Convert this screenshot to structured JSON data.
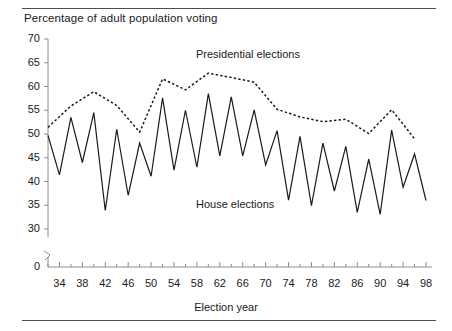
{
  "chart_data": {
    "type": "line",
    "title": "Percentage of adult population voting",
    "xlabel": "Election year",
    "ylabel": "",
    "xlim": [
      32,
      98
    ],
    "ylim": [
      30,
      70
    ],
    "y_axis_break": true,
    "y_zero_label": "0",
    "grid": false,
    "legend_position": "inline-annotations",
    "yticks": [
      30,
      35,
      40,
      45,
      50,
      55,
      60,
      65,
      70
    ],
    "ytick_labels": [
      "30",
      "35",
      "40",
      "45",
      "50",
      "55",
      "60",
      "65",
      "70"
    ],
    "xticks": [
      34,
      38,
      42,
      46,
      50,
      54,
      58,
      62,
      66,
      70,
      74,
      78,
      82,
      86,
      90,
      94,
      98
    ],
    "xtick_labels": [
      "34",
      "38",
      "42",
      "46",
      "50",
      "54",
      "58",
      "62",
      "66",
      "70",
      "74",
      "78",
      "82",
      "86",
      "90",
      "94",
      "98"
    ],
    "xtick_minor_step": 2,
    "series": [
      {
        "name": "House elections",
        "style": "solid",
        "color": "#1a1a1a",
        "x": [
          32,
          34,
          36,
          38,
          40,
          42,
          44,
          46,
          48,
          50,
          52,
          54,
          56,
          58,
          60,
          62,
          64,
          66,
          68,
          70,
          72,
          74,
          76,
          78,
          80,
          82,
          84,
          86,
          88,
          90,
          92,
          94,
          96,
          98
        ],
        "values": [
          49.7,
          41.4,
          53.5,
          44.0,
          54.5,
          33.9,
          51.0,
          37.1,
          48.1,
          41.1,
          57.6,
          42.4,
          55.0,
          43.0,
          58.5,
          45.4,
          57.8,
          45.4,
          55.1,
          43.5,
          50.7,
          36.1,
          49.5,
          34.9,
          48.1,
          38.0,
          47.4,
          33.5,
          44.7,
          33.1,
          50.8,
          38.8,
          45.8,
          36.0
        ]
      },
      {
        "name": "Presidential elections",
        "style": "dashed",
        "color": "#1a1a1a",
        "x": [
          32,
          36,
          40,
          44,
          48,
          52,
          56,
          60,
          64,
          68,
          72,
          76,
          80,
          84,
          88,
          92,
          96
        ],
        "values": [
          51.4,
          55.9,
          58.9,
          56.0,
          50.4,
          61.6,
          59.3,
          62.8,
          61.9,
          60.9,
          55.2,
          53.6,
          52.6,
          53.1,
          50.1,
          55.1,
          49.0
        ]
      }
    ],
    "annotations": [
      {
        "text": "Presidential elections",
        "x": 62,
        "y": 66.5
      },
      {
        "text": "House elections",
        "x": 62,
        "y": 38.5
      }
    ]
  },
  "axis": {
    "y_zero": "0"
  }
}
